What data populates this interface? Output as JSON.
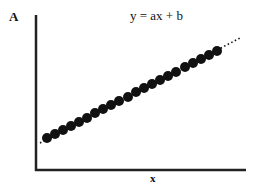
{
  "chart_data": {
    "type": "scatter",
    "title": "y = ax + b",
    "xlabel": "x",
    "ylabel": "A",
    "grid": false,
    "legend": null,
    "annotations": [
      "y = ax + b"
    ],
    "ticks": {
      "x": [],
      "y": []
    },
    "trendline": {
      "style": "dotted",
      "extends_beyond_points": true,
      "form": "linear"
    },
    "point_count": 22,
    "points_px": [
      [
        47,
        138
      ],
      [
        55,
        134
      ],
      [
        63,
        130
      ],
      [
        71,
        126
      ],
      [
        79,
        122
      ],
      [
        87,
        118
      ],
      [
        95,
        113
      ],
      [
        103,
        109
      ],
      [
        111,
        105
      ],
      [
        119,
        101
      ],
      [
        128,
        97
      ],
      [
        136,
        92
      ],
      [
        144,
        88
      ],
      [
        152,
        84
      ],
      [
        160,
        80
      ],
      [
        168,
        76
      ],
      [
        176,
        72
      ],
      [
        185,
        67
      ],
      [
        193,
        63
      ],
      [
        201,
        59
      ],
      [
        209,
        55
      ],
      [
        217,
        51
      ]
    ],
    "axes_px": {
      "origin": [
        36,
        170
      ],
      "y_top": [
        36,
        15
      ],
      "x_right": [
        246,
        170
      ]
    },
    "trend_px": {
      "start": [
        40,
        143
      ],
      "end": [
        240,
        38
      ]
    },
    "colors": {
      "points": "#111111",
      "axes": "#222222",
      "background": "#ffffff"
    }
  },
  "labels": {
    "y_axis": "A",
    "x_axis": "x",
    "equation": "y = ax + b"
  }
}
